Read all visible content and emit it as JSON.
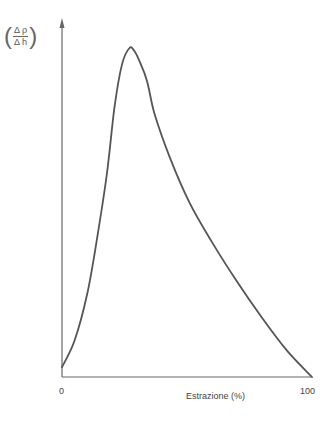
{
  "chart_data": {
    "type": "line",
    "title": "",
    "xlabel": "Estrazione (%)",
    "ylabel": {
      "numerator": "Δ ρ",
      "denominator": "Δ h"
    },
    "xlim": [
      0,
      100
    ],
    "x_ticks": [
      "0",
      "100"
    ],
    "grid": false,
    "legend": null,
    "series": [
      {
        "name": "Δρ/Δh",
        "x": [
          0,
          5,
          10,
          14,
          18,
          21,
          24,
          27,
          29,
          31,
          34,
          37,
          43,
          51,
          60,
          70,
          80,
          90,
          100
        ],
        "y": [
          0.03,
          0.11,
          0.25,
          0.42,
          0.62,
          0.82,
          0.95,
          1.0,
          0.99,
          0.96,
          0.9,
          0.8,
          0.67,
          0.53,
          0.41,
          0.29,
          0.18,
          0.08,
          0.0
        ]
      }
    ]
  },
  "axes": {
    "x_origin_label": "0",
    "x_end_label": "100",
    "x_title": "Estrazione (%)",
    "y_num": "Δ ρ",
    "y_den": "Δ h",
    "line_color": "#555555"
  }
}
